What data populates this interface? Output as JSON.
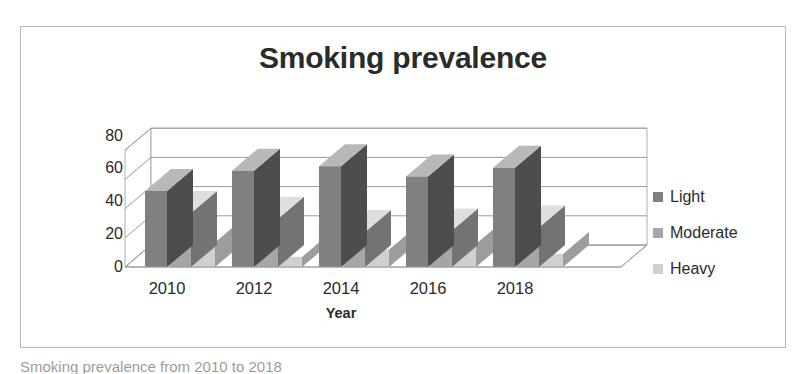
{
  "chart_data": {
    "type": "bar",
    "subtype": "3d-clustered-column",
    "title": "Smoking prevalence",
    "xlabel": "Year",
    "ylabel": "Smoking percentage",
    "categories": [
      "2010",
      "2012",
      "2014",
      "2016",
      "2018"
    ],
    "series": [
      {
        "name": "Light",
        "values": [
          52,
          66,
          69,
          62,
          68
        ],
        "color": "#808080"
      },
      {
        "name": "Moderate",
        "values": [
          37,
          33,
          24,
          25,
          27
        ],
        "color": "#a6a6a6"
      },
      {
        "name": "Heavy",
        "values": [
          17,
          7,
          12,
          16,
          9
        ],
        "color": "#d0d0d0"
      }
    ],
    "ylim": [
      0,
      80
    ],
    "yticks": [
      "0",
      "20",
      "40",
      "60",
      "80"
    ],
    "ytick_values": [
      0,
      20,
      40,
      60,
      80
    ],
    "grid": true,
    "legend_position": "right"
  },
  "legend": {
    "items": [
      {
        "label": "Light",
        "swatch": "#808080"
      },
      {
        "label": "Moderate",
        "swatch": "#a6a6a6"
      },
      {
        "label": "Heavy",
        "swatch": "#d0d0d0"
      }
    ]
  },
  "caption": {
    "text": "Smoking prevalence from 2010 to 2018"
  },
  "colors": {
    "frame_border": "#b9b9b9",
    "gridline": "#9a9a9a",
    "text": "#2b2b2b",
    "background": "#ffffff"
  }
}
